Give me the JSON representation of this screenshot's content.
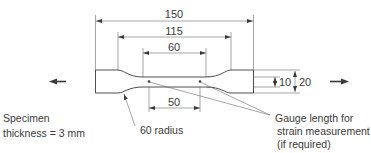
{
  "diagram": {
    "units": "mm",
    "dimensions": {
      "overall_length": "150",
      "shoulder_to_shoulder": "115",
      "parallel_length": "60",
      "gauge_length": "50",
      "neck_width": "10",
      "grip_width": "20"
    },
    "labels": {
      "specimen_line1": "Specimen",
      "specimen_line2": "thickness = 3 mm",
      "radius": "60 radius",
      "gauge_line1": "Gauge length for",
      "gauge_line2": "strain measurement",
      "gauge_line3": "(if required)"
    },
    "load_arrows": [
      "left-arrow",
      "right-arrow"
    ],
    "colors": {
      "line": "#3a3a3a",
      "thin_line": "#6a6a6a",
      "background": "#ffffff"
    }
  }
}
